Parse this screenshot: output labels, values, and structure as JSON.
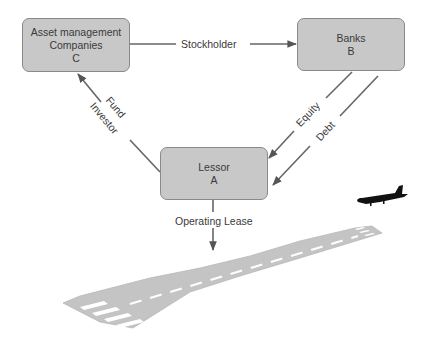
{
  "diagram": {
    "nodes": {
      "asset_management": {
        "line1": "Asset management",
        "line2": "Companies",
        "id": "C"
      },
      "banks": {
        "line1": "Banks",
        "id": "B"
      },
      "lessor": {
        "line1": "Lessor",
        "id": "A"
      }
    },
    "edges": {
      "stockholder": {
        "label": "Stockholder",
        "from": "C",
        "to": "B"
      },
      "fund_investor": {
        "label_line1": "Fund",
        "label_line2": "Investor",
        "from": "A",
        "to": "C"
      },
      "equity": {
        "label": "Equity",
        "from": "B",
        "to": "A"
      },
      "debt": {
        "label": "Debt",
        "from": "B",
        "to": "A"
      },
      "operating_lease": {
        "label": "Operating Lease",
        "from": "A",
        "to": "runway"
      }
    },
    "illustrations": {
      "runway": "runway-illustration",
      "airplane": "airplane-icon"
    },
    "colors": {
      "node_fill": "#c8c8c8",
      "node_border": "#8a8a8a",
      "arrow": "#666666",
      "runway": "#c4c4c4",
      "airplane": "#111111"
    }
  }
}
